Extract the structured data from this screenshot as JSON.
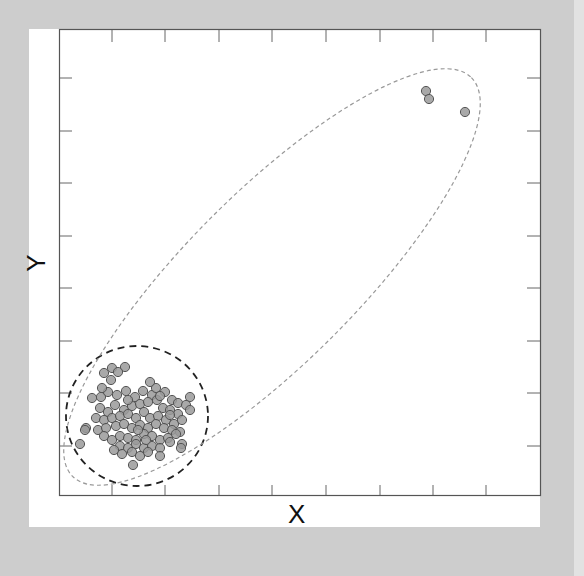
{
  "chart_data": {
    "type": "scatter",
    "title": "",
    "xlabel": "X",
    "ylabel": "Y",
    "tick_labels": "none (unlabeled inward ticks on all four sides)",
    "grid": false,
    "legend": null,
    "pixel_frame": {
      "left": 59,
      "top": 29,
      "right": 540,
      "bottom": 495
    },
    "x_ticks_px": [
      112,
      165,
      219,
      272,
      326,
      380,
      433,
      486
    ],
    "y_ticks_px": [
      78,
      131,
      183,
      236,
      288,
      341,
      393,
      446
    ],
    "series": [
      {
        "name": "cluster",
        "marker": "circle",
        "color": "#9a9a9a",
        "edge": "#555555",
        "points_px": [
          [
            104,
            373
          ],
          [
            112,
            368
          ],
          [
            125,
            367
          ],
          [
            111,
            380
          ],
          [
            92,
            398
          ],
          [
            101,
            397
          ],
          [
            108,
            392
          ],
          [
            117,
            395
          ],
          [
            126,
            391
          ],
          [
            135,
            397
          ],
          [
            143,
            391
          ],
          [
            152,
            395
          ],
          [
            156,
            388
          ],
          [
            165,
            392
          ],
          [
            172,
            400
          ],
          [
            178,
            403
          ],
          [
            190,
            397
          ],
          [
            186,
            405
          ],
          [
            100,
            408
          ],
          [
            108,
            412
          ],
          [
            115,
            405
          ],
          [
            124,
            410
          ],
          [
            132,
            406
          ],
          [
            140,
            404
          ],
          [
            148,
            402
          ],
          [
            157,
            400
          ],
          [
            163,
            408
          ],
          [
            170,
            410
          ],
          [
            178,
            414
          ],
          [
            96,
            418
          ],
          [
            104,
            420
          ],
          [
            112,
            418
          ],
          [
            120,
            416
          ],
          [
            128,
            414
          ],
          [
            136,
            418
          ],
          [
            144,
            412
          ],
          [
            150,
            418
          ],
          [
            158,
            416
          ],
          [
            166,
            420
          ],
          [
            174,
            424
          ],
          [
            182,
            420
          ],
          [
            86,
            428
          ],
          [
            98,
            430
          ],
          [
            106,
            428
          ],
          [
            116,
            426
          ],
          [
            124,
            424
          ],
          [
            132,
            428
          ],
          [
            140,
            425
          ],
          [
            148,
            428
          ],
          [
            156,
            424
          ],
          [
            164,
            428
          ],
          [
            172,
            430
          ],
          [
            180,
            432
          ],
          [
            104,
            436
          ],
          [
            112,
            440
          ],
          [
            120,
            436
          ],
          [
            128,
            438
          ],
          [
            136,
            440
          ],
          [
            144,
            434
          ],
          [
            152,
            436
          ],
          [
            160,
            440
          ],
          [
            168,
            438
          ],
          [
            120,
            446
          ],
          [
            128,
            448
          ],
          [
            136,
            444
          ],
          [
            144,
            448
          ],
          [
            152,
            446
          ],
          [
            160,
            448
          ],
          [
            170,
            442
          ],
          [
            182,
            444
          ],
          [
            122,
            454
          ],
          [
            132,
            452
          ],
          [
            140,
            456
          ],
          [
            148,
            452
          ],
          [
            160,
            456
          ],
          [
            181,
            448
          ],
          [
            133,
            465
          ],
          [
            80,
            444
          ],
          [
            85,
            430
          ],
          [
            190,
            410
          ],
          [
            118,
            372
          ],
          [
            102,
            388
          ],
          [
            150,
            382
          ],
          [
            160,
            396
          ],
          [
            128,
            400
          ],
          [
            138,
            430
          ],
          [
            146,
            440
          ],
          [
            114,
            450
          ],
          [
            170,
            415
          ],
          [
            176,
            434
          ]
        ]
      },
      {
        "name": "outliers",
        "marker": "circle",
        "color": "#9a9a9a",
        "edge": "#555555",
        "points_px": [
          [
            426,
            91
          ],
          [
            429,
            99
          ],
          [
            465,
            112
          ]
        ]
      }
    ],
    "annotations": [
      {
        "type": "ellipse",
        "style": "dashed",
        "color": "#222222",
        "cx": 137,
        "cy": 416,
        "rx": 71,
        "ry": 70,
        "angle": 0,
        "description": "tight boundary around main cluster"
      },
      {
        "type": "ellipse",
        "style": "dotted",
        "color": "#999999",
        "cx": 272,
        "cy": 277,
        "rx": 282,
        "ry": 85,
        "angle": -45,
        "description": "elongated boundary enclosing cluster and outliers"
      }
    ]
  }
}
